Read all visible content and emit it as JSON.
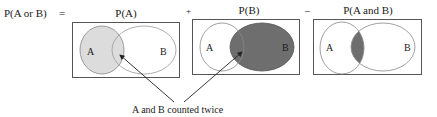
{
  "equation": {
    "lhs": "P(A or B)",
    "equals": "=",
    "plus": "+",
    "minus": "–"
  },
  "panels": [
    {
      "title": "P(A)",
      "label_a": "A",
      "label_b": "B",
      "shaded": "A",
      "shade_color": "#dcdcdc"
    },
    {
      "title": "P(B)",
      "label_a": "A",
      "label_b": "B",
      "shaded": "B",
      "shade_color": "#6e6e6e"
    },
    {
      "title": "P(A and B)",
      "label_a": "A",
      "label_b": "B",
      "shaded": "A and B",
      "shade_color": "#6e6e6e"
    }
  ],
  "annotation": {
    "text": "A and B counted twice"
  },
  "colors": {
    "outline": "#8a8a8a",
    "box": "#555555",
    "light_shade": "#dcdcdc",
    "dark_shade": "#6e6e6e",
    "arrow": "#222222"
  }
}
